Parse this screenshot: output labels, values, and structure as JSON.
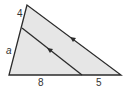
{
  "diagram": {
    "type": "triangle-proportionality",
    "colors": {
      "fill": "#e6e6e6",
      "stroke": "#2b2b2b",
      "text": "#333333"
    },
    "labels": {
      "left_upper_segment": "4",
      "left_lower_segment": "a",
      "bottom_left_segment": "8",
      "bottom_right_segment": "5"
    },
    "parallel_marks": "single arrow on each parallel line"
  }
}
